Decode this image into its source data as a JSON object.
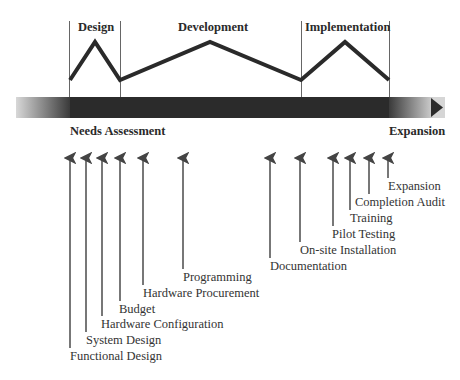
{
  "diagram": {
    "type": "timeline",
    "phases": [
      {
        "label": "Design"
      },
      {
        "label": "Development"
      },
      {
        "label": "Implementation"
      }
    ],
    "bar_start_label": "Needs Assessment",
    "bar_end_label": "Expansion",
    "milestones_left": [
      {
        "label": "Functional Design"
      },
      {
        "label": "System Design"
      },
      {
        "label": "Hardware Configuration"
      },
      {
        "label": "Budget"
      },
      {
        "label": "Hardware Procurement"
      },
      {
        "label": "Programming"
      }
    ],
    "milestones_right": [
      {
        "label": "Documentation"
      },
      {
        "label": "On-site Installation"
      },
      {
        "label": "Pilot Testing"
      },
      {
        "label": "Training"
      },
      {
        "label": "Completion Audit"
      },
      {
        "label": "Expansion"
      }
    ],
    "colors": {
      "bar": "#2b2b2b",
      "line": "#2a2a2a",
      "divider": "#555555",
      "arrow": "#555555"
    }
  }
}
